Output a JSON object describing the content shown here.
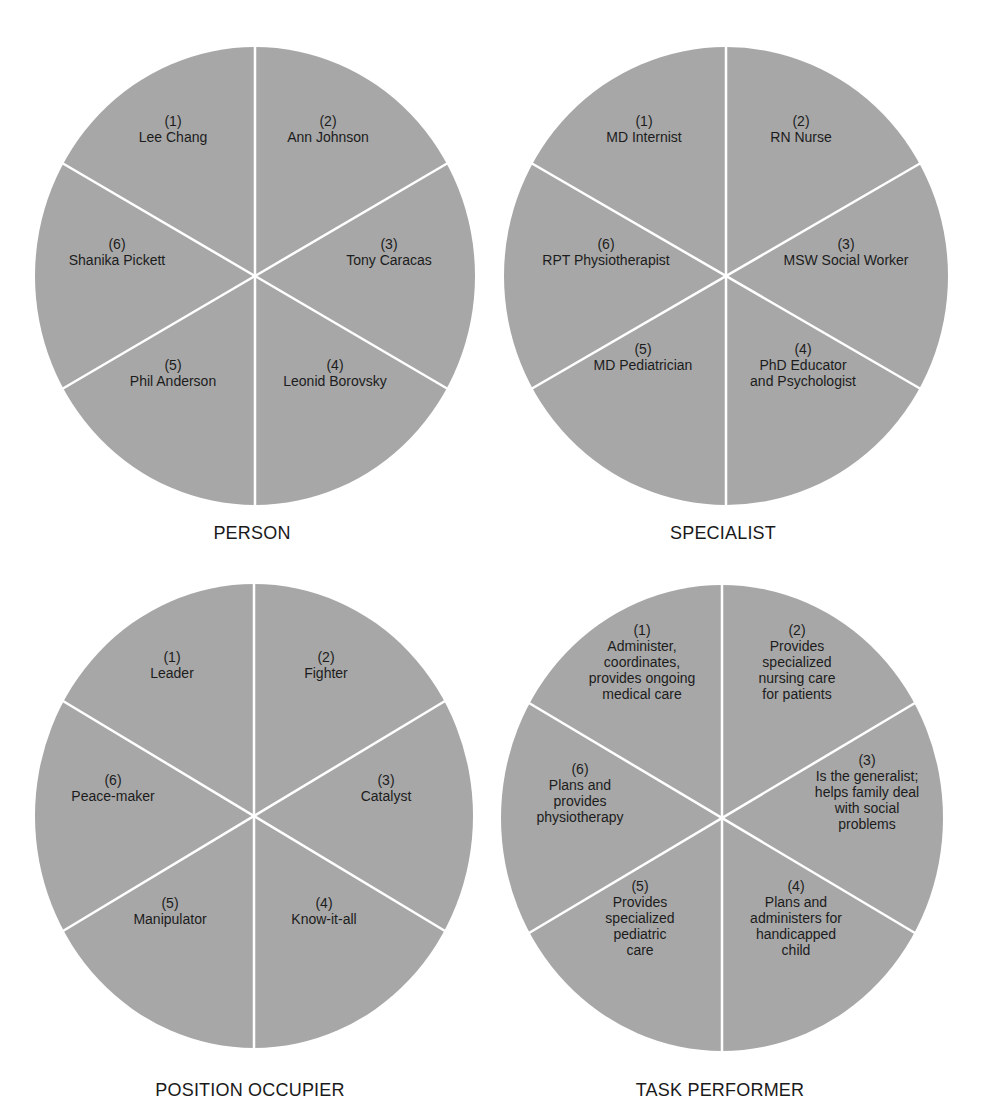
{
  "style": {
    "fill": "#a7a7a7",
    "divider": "#ffffff",
    "text": "#1c1c1c",
    "background": "#ffffff"
  },
  "diagrams": [
    {
      "caption": "PERSON",
      "segments": [
        {
          "num": "(1)",
          "lines": [
            "Lee Chang"
          ]
        },
        {
          "num": "(2)",
          "lines": [
            "Ann Johnson"
          ]
        },
        {
          "num": "(3)",
          "lines": [
            "Tony Caracas"
          ]
        },
        {
          "num": "(4)",
          "lines": [
            "Leonid Borovsky"
          ]
        },
        {
          "num": "(5)",
          "lines": [
            "Phil Anderson"
          ]
        },
        {
          "num": "(6)",
          "lines": [
            "Shanika Pickett"
          ]
        }
      ]
    },
    {
      "caption": "SPECIALIST",
      "segments": [
        {
          "num": "(1)",
          "lines": [
            "MD Internist"
          ]
        },
        {
          "num": "(2)",
          "lines": [
            "RN Nurse"
          ]
        },
        {
          "num": "(3)",
          "lines": [
            "MSW Social Worker"
          ]
        },
        {
          "num": "(4)",
          "lines": [
            "PhD Educator",
            "and Psychologist"
          ]
        },
        {
          "num": "(5)",
          "lines": [
            "MD Pediatrician"
          ]
        },
        {
          "num": "(6)",
          "lines": [
            "RPT Physiotherapist"
          ]
        }
      ]
    },
    {
      "caption": "POSITION OCCUPIER",
      "segments": [
        {
          "num": "(1)",
          "lines": [
            "Leader"
          ]
        },
        {
          "num": "(2)",
          "lines": [
            "Fighter"
          ]
        },
        {
          "num": "(3)",
          "lines": [
            "Catalyst"
          ]
        },
        {
          "num": "(4)",
          "lines": [
            "Know-it-all"
          ]
        },
        {
          "num": "(5)",
          "lines": [
            "Manipulator"
          ]
        },
        {
          "num": "(6)",
          "lines": [
            "Peace-maker"
          ]
        }
      ]
    },
    {
      "caption": "TASK PERFORMER",
      "segments": [
        {
          "num": "(1)",
          "lines": [
            "Administer,",
            "coordinates,",
            "provides ongoing",
            "medical care"
          ]
        },
        {
          "num": "(2)",
          "lines": [
            "Provides",
            "specialized",
            "nursing care",
            "for patients"
          ]
        },
        {
          "num": "(3)",
          "lines": [
            "Is the generalist;",
            "helps family deal",
            "with social",
            "problems"
          ]
        },
        {
          "num": "(4)",
          "lines": [
            "Plans and",
            "administers for",
            "handicapped",
            "child"
          ]
        },
        {
          "num": "(5)",
          "lines": [
            "Provides",
            "specialized",
            "pediatric",
            "care"
          ]
        },
        {
          "num": "(6)",
          "lines": [
            "Plans and",
            "provides",
            "physiotherapy"
          ]
        }
      ]
    }
  ]
}
